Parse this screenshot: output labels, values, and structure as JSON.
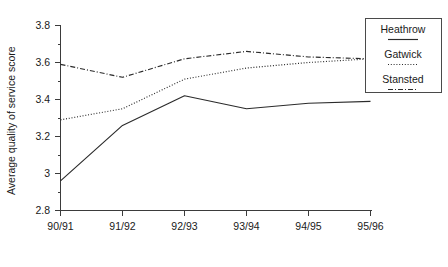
{
  "chart_data": {
    "type": "line",
    "title": "",
    "xlabel": "",
    "ylabel": "Average quality of service score",
    "categories": [
      "90/91",
      "91/92",
      "92/93",
      "93/94",
      "94/95",
      "95/96"
    ],
    "ylim": [
      2.8,
      3.8
    ],
    "yticks": [
      "2.8",
      "3",
      "3.2",
      "3.4",
      "3.6",
      "3.8"
    ],
    "ytick_values": [
      2.8,
      3.0,
      3.2,
      3.4,
      3.6,
      3.8
    ],
    "minor_ticks": true,
    "grid": false,
    "legend_position": "right",
    "series": [
      {
        "name": "Heathrow",
        "style": "solid",
        "values": [
          2.96,
          3.26,
          3.42,
          3.35,
          3.38,
          3.39
        ]
      },
      {
        "name": "Gatwick",
        "style": "dotted",
        "values": [
          3.29,
          3.35,
          3.51,
          3.57,
          3.6,
          3.62
        ]
      },
      {
        "name": "Stansted",
        "style": "dash-dot",
        "values": [
          3.59,
          3.52,
          3.62,
          3.66,
          3.63,
          3.62
        ]
      }
    ]
  },
  "legend": {
    "entries": [
      {
        "label": "Heathrow",
        "style": "solid"
      },
      {
        "label": "Gatwick",
        "style": "dotted"
      },
      {
        "label": "Stansted",
        "style": "dash-dot"
      }
    ]
  },
  "axes": {
    "y_title": "Average quality of service score",
    "y_labels": [
      "3.8",
      "3.6",
      "3.4",
      "3.2",
      "3",
      "2.8"
    ],
    "x_labels": [
      "90/91",
      "91/92",
      "92/93",
      "93/94",
      "94/95",
      "95/96"
    ]
  }
}
